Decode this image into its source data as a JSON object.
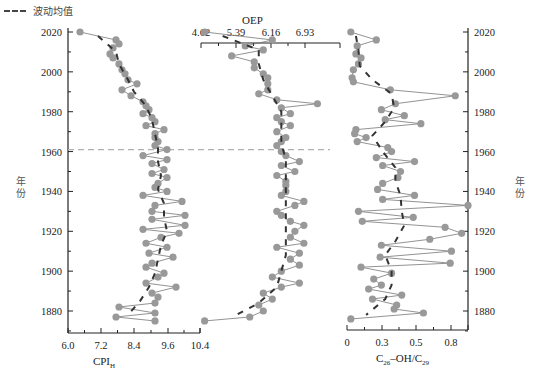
{
  "legend": {
    "label": "波动均值",
    "style": "dashed",
    "color": "#444444"
  },
  "y_axis_label": "年份",
  "colors": {
    "marker": "#999999",
    "line": "#777777",
    "mean": "#333333",
    "reference_line": "#b0b0b0"
  },
  "chart_data": [
    {
      "type": "line",
      "orientation": "vertical (depth profile)",
      "panel": "left",
      "xlabel": "CPI_H",
      "x_ticks": [
        "6.0",
        "7.2",
        "8.4",
        "9.6",
        "10.4"
      ],
      "xlim": [
        6.0,
        10.4
      ],
      "x_axis_position": "bottom",
      "ylabel": "年份",
      "y_ticks": [
        "1880",
        "1900",
        "1920",
        "1940",
        "1960",
        "1980",
        "2000",
        "2020"
      ],
      "ylim": [
        1870,
        2022
      ],
      "series": [
        {
          "name": "CPI_H",
          "year": [
            2020,
            2016,
            2014,
            2012,
            2009,
            2007,
            2004,
            2001,
            1999,
            1996,
            1994,
            1991,
            1988,
            1985,
            1983,
            1981,
            1979,
            1977,
            1975,
            1973,
            1971,
            1969,
            1967,
            1965,
            1963,
            1961,
            1958,
            1956,
            1954,
            1951,
            1949,
            1947,
            1944,
            1942,
            1940,
            1938,
            1935,
            1933,
            1930,
            1928,
            1926,
            1923,
            1921,
            1919,
            1917,
            1914,
            1912,
            1909,
            1907,
            1904,
            1902,
            1899,
            1897,
            1894,
            1892,
            1889,
            1887,
            1884,
            1882,
            1879,
            1877,
            1875
          ],
          "value": [
            6.4,
            7.6,
            7.7,
            7.5,
            7.4,
            7.5,
            7.7,
            7.8,
            7.9,
            8.0,
            8.3,
            7.8,
            8.1,
            8.5,
            8.6,
            8.7,
            8.5,
            8.8,
            8.9,
            8.6,
            9.2,
            8.9,
            8.9,
            9.0,
            8.9,
            9.3,
            8.5,
            9.3,
            8.8,
            9.2,
            8.8,
            9.3,
            9.0,
            8.9,
            9.3,
            8.5,
            9.8,
            8.9,
            8.8,
            9.9,
            8.8,
            9.9,
            8.5,
            9.7,
            9.1,
            8.6,
            9.3,
            8.7,
            9.5,
            8.8,
            8.6,
            9.2,
            9.0,
            8.6,
            9.6,
            8.8,
            9.0,
            8.9,
            7.7,
            8.9,
            7.6,
            8.9
          ]
        },
        {
          "name": "波动均值",
          "year": [
            2018,
            2010,
            2004,
            1996,
            1990,
            1983,
            1976,
            1969,
            1962,
            1955,
            1948,
            1941,
            1934,
            1927,
            1920,
            1913,
            1906,
            1899,
            1892,
            1885,
            1878
          ],
          "value": [
            7.0,
            7.6,
            7.7,
            8.0,
            8.2,
            8.6,
            8.8,
            8.9,
            9.0,
            9.0,
            9.1,
            9.0,
            9.2,
            9.2,
            9.3,
            9.1,
            9.0,
            8.9,
            8.7,
            8.4,
            8.0
          ]
        }
      ]
    },
    {
      "type": "line",
      "orientation": "vertical (depth profile)",
      "panel": "middle",
      "xlabel": "OEP",
      "x_ticks": [
        "4.62",
        "5.39",
        "6.16",
        "6.93"
      ],
      "xlim": [
        4.62,
        7.7
      ],
      "x_axis_position": "top",
      "series": [
        {
          "name": "OEP",
          "year": [
            2020,
            2016,
            2013,
            2011,
            2008,
            2005,
            2002,
            1999,
            1997,
            1994,
            1991,
            1989,
            1986,
            1984,
            1982,
            1979,
            1977,
            1975,
            1973,
            1970,
            1967,
            1965,
            1963,
            1960,
            1958,
            1955,
            1953,
            1950,
            1948,
            1945,
            1943,
            1940,
            1938,
            1935,
            1933,
            1930,
            1928,
            1925,
            1923,
            1920,
            1917,
            1914,
            1912,
            1909,
            1906,
            1903,
            1900,
            1897,
            1894,
            1892,
            1889,
            1886,
            1883,
            1880,
            1877,
            1875
          ],
          "value": [
            4.7,
            6.2,
            5.6,
            6.0,
            5.3,
            5.8,
            5.8,
            6.0,
            6.1,
            6.1,
            6.1,
            5.9,
            6.3,
            7.2,
            6.4,
            6.6,
            6.3,
            6.4,
            6.6,
            6.3,
            6.5,
            6.4,
            6.3,
            6.4,
            6.5,
            6.8,
            6.4,
            6.7,
            6.3,
            6.5,
            6.5,
            6.5,
            6.4,
            6.9,
            6.7,
            6.3,
            6.4,
            6.6,
            6.9,
            6.7,
            6.6,
            6.9,
            6.3,
            6.8,
            6.6,
            6.8,
            6.4,
            6.2,
            6.8,
            6.4,
            6.0,
            6.2,
            5.9,
            6.0,
            5.7,
            4.7
          ]
        },
        {
          "name": "波动均值",
          "year": [
            2018,
            2011,
            2004,
            1996,
            1988,
            1980,
            1972,
            1964,
            1956,
            1948,
            1940,
            1932,
            1924,
            1916,
            1908,
            1900,
            1892,
            1884,
            1878
          ],
          "value": [
            5.1,
            5.9,
            5.9,
            6.0,
            6.2,
            6.4,
            6.4,
            6.4,
            6.5,
            6.5,
            6.5,
            6.5,
            6.5,
            6.5,
            6.5,
            6.4,
            6.3,
            5.9,
            5.4
          ]
        }
      ]
    },
    {
      "type": "line",
      "orientation": "vertical (depth profile)",
      "panel": "right",
      "xlabel": "C26-OH/C29",
      "x_ticks": [
        "0",
        "0.3",
        "0.5",
        "0.8"
      ],
      "xlim": [
        0,
        0.95
      ],
      "x_axis_position": "bottom",
      "ylabel": "年份",
      "y_axis_position": "right",
      "y_ticks": [
        "1880",
        "1900",
        "1920",
        "1940",
        "1960",
        "1980",
        "2000",
        "2020"
      ],
      "series": [
        {
          "name": "C26-OH/C29",
          "year": [
            2020,
            2016,
            2013,
            2009,
            2007,
            2004,
            2001,
            1997,
            1995,
            1991,
            1988,
            1984,
            1981,
            1978,
            1976,
            1974,
            1971,
            1969,
            1967,
            1965,
            1962,
            1960,
            1957,
            1955,
            1953,
            1950,
            1947,
            1944,
            1941,
            1938,
            1936,
            1933,
            1930,
            1927,
            1925,
            1922,
            1919,
            1916,
            1913,
            1910,
            1907,
            1904,
            1902,
            1899,
            1896,
            1893,
            1891,
            1888,
            1886,
            1883,
            1881,
            1879,
            1876
          ],
          "value": [
            0.03,
            0.23,
            0.08,
            0.07,
            0.11,
            0.09,
            0.05,
            0.04,
            0.05,
            0.34,
            0.85,
            0.38,
            0.27,
            0.45,
            0.3,
            0.58,
            0.07,
            0.06,
            0.15,
            0.08,
            0.32,
            0.35,
            0.23,
            0.53,
            0.28,
            0.42,
            0.4,
            0.28,
            0.24,
            0.53,
            0.28,
            0.95,
            0.09,
            0.52,
            0.12,
            0.77,
            0.9,
            0.65,
            0.27,
            0.82,
            0.26,
            0.81,
            0.11,
            0.35,
            0.21,
            0.27,
            0.17,
            0.43,
            0.2,
            0.39,
            0.37,
            0.6,
            0.03
          ]
        },
        {
          "name": "波动均值",
          "year": [
            2018,
            2011,
            2003,
            1996,
            1989,
            1982,
            1975,
            1968,
            1960,
            1952,
            1945,
            1938,
            1930,
            1923,
            1915,
            1908,
            1900,
            1893,
            1886,
            1878
          ],
          "value": [
            0.07,
            0.09,
            0.1,
            0.2,
            0.35,
            0.37,
            0.3,
            0.2,
            0.28,
            0.38,
            0.38,
            0.42,
            0.43,
            0.45,
            0.38,
            0.3,
            0.35,
            0.35,
            0.3,
            0.15
          ]
        }
      ]
    }
  ],
  "reference_line": {
    "year": 1961,
    "style": "dashed",
    "spans": "left and middle panels"
  }
}
